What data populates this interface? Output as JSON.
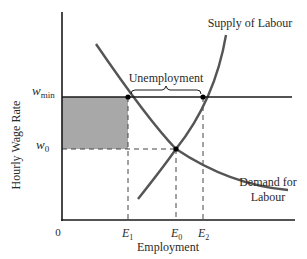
{
  "diagram": {
    "y_axis_label": "Hourly Wage Rate",
    "x_axis_label": "Employment",
    "origin_label": "0",
    "wage_labels": {
      "w_min": {
        "base": "w",
        "sub": "min"
      },
      "w_0": {
        "base": "w",
        "sub": "0"
      }
    },
    "employment_labels": {
      "E1": {
        "base": "E",
        "sub": "1"
      },
      "E0": {
        "base": "E",
        "sub": "0"
      },
      "E2": {
        "base": "E",
        "sub": "2"
      }
    },
    "curves": {
      "supply": {
        "label": "Supply of Labour"
      },
      "demand": {
        "label_line1": "Demand for",
        "label_line2": "Labour"
      }
    },
    "unemployment_label": "Unemployment",
    "colors": {
      "axis": "#1a1a1a",
      "curve": "#555555",
      "shaded": "#a8a8a8",
      "dashed": "#444444",
      "text": "#2a2a2a"
    }
  }
}
